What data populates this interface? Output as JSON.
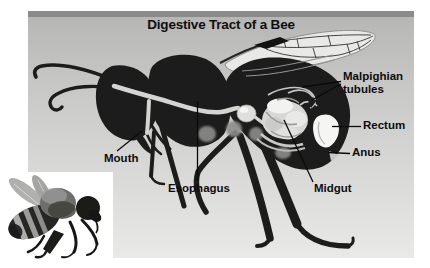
{
  "title": "Digestive Tract of a Bee",
  "labels": {
    "mouth": "Mouth",
    "esophagus": "Esophagus",
    "midgut": "Midgut",
    "malpighian_tubules": "Malpighian tubules",
    "rectum": "Rectum",
    "anus": "Anus"
  },
  "colors": {
    "panel_top_bar": "#8b8b89",
    "panel_bg_top": "#b5b5b3",
    "panel_bg_bottom": "#e9e9e7",
    "bee_silhouette": "#1d1d1b",
    "digestive_tract_light": "#d4d4d2",
    "organ_highlight": "#f5f5f3",
    "label_text": "#0d0d0d"
  },
  "figures": {
    "diagram_bee": "side-view bee silhouette with light digestive tract",
    "photo_bee": "grayscale honeybee photograph, bottom-left corner"
  }
}
